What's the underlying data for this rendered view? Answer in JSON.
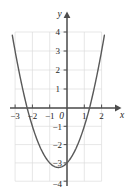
{
  "chart_data": {
    "type": "line",
    "title": "",
    "subtitle": "",
    "xlabel": "x",
    "ylabel": "y",
    "xlim": [
      -3,
      2
    ],
    "ylim": [
      -4,
      4
    ],
    "grid": true,
    "grid_spacing": 1,
    "legend": "none",
    "xticks": [
      -3,
      -2,
      -1,
      0,
      1,
      2
    ],
    "xtick_labels": [
      "−3",
      "−2",
      "−1",
      "0",
      "1",
      "2"
    ],
    "yticks": [
      -4,
      -3,
      -2,
      -1,
      1,
      2,
      3,
      4
    ],
    "ytick_labels": [
      "−4",
      "−3",
      "−2",
      "−1",
      "1",
      "2",
      "3",
      "4"
    ],
    "origin_label": "0",
    "curve": {
      "name": "parabola",
      "equation": "y = x^2 + x - 3",
      "color": "#595959",
      "vertex": [
        -0.5,
        -3.25
      ],
      "roots": [
        -2.3,
        1.3
      ],
      "y_intercept": -3,
      "x": [
        -2.92,
        -2.8,
        -2.6,
        -2.4,
        -2.2,
        -2.0,
        -1.8,
        -1.6,
        -1.4,
        -1.2,
        -1.0,
        -0.8,
        -0.6,
        -0.5,
        -0.4,
        -0.2,
        0.0,
        0.2,
        0.4,
        0.6,
        0.8,
        1.0,
        1.2,
        1.4,
        1.6,
        1.8,
        1.92
      ],
      "y": [
        3.61,
        3.04,
        2.16,
        1.36,
        0.64,
        -1.0,
        -1.56,
        -2.04,
        -2.44,
        -2.76,
        -3.0,
        -3.16,
        -3.24,
        -3.25,
        -3.24,
        -3.16,
        -3.0,
        -2.76,
        -2.44,
        -2.04,
        -1.56,
        -1.0,
        -0.36,
        0.36,
        1.16,
        2.04,
        2.61
      ]
    },
    "colors": {
      "curve": "#595959",
      "axis": "#4d4d4d",
      "grid": "#dcdcdc",
      "text": "#262626",
      "background": "#ffffff"
    }
  },
  "labels": {
    "x_axis_name": "x",
    "y_axis_name": "y",
    "origin": "0",
    "x_neg3": "−3",
    "x_neg2": "−2",
    "x_neg1": "−1",
    "x_pos1": "1",
    "x_pos2": "2",
    "y_pos1": "1",
    "y_pos2": "2",
    "y_pos3": "3",
    "y_pos4": "4",
    "y_neg1": "−1",
    "y_neg2": "−2",
    "y_neg3": "−3",
    "y_neg4": "−4"
  }
}
